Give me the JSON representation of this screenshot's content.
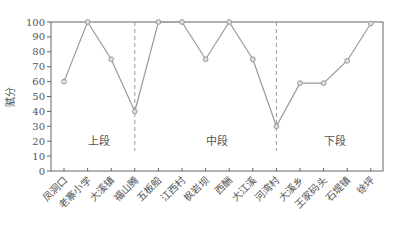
{
  "chart_data": {
    "type": "line",
    "title": "",
    "xlabel": "",
    "ylabel": "赋分",
    "ylim": [
      0,
      100
    ],
    "yticks": [
      0,
      10,
      20,
      30,
      40,
      50,
      60,
      70,
      80,
      90,
      100
    ],
    "grid": false,
    "legend": null,
    "categories": [
      "凤洞口",
      "老寨小学",
      "大溪镇",
      "福山腾",
      "五板船",
      "江西村",
      "枫岩坝",
      "西酬",
      "大江溪",
      "河湾村",
      "大溪乡",
      "王家码头",
      "石堤镇",
      "徐坪"
    ],
    "series": [
      {
        "name": "赋分",
        "values": [
          60,
          100,
          75,
          40,
          100,
          100,
          75,
          100,
          75,
          30,
          59,
          59,
          74,
          99
        ],
        "color": "#999999",
        "marker": "circle"
      }
    ],
    "segment_dividers": [
      {
        "after_category": "福山腾",
        "style": "dashed"
      },
      {
        "after_category": "河湾村",
        "style": "dashed"
      }
    ],
    "annotations": [
      {
        "text": "上段",
        "x_center_between": [
          "老寨小学",
          "大溪镇"
        ],
        "y": 20
      },
      {
        "text": "中段",
        "x_center_between": [
          "枫岩坝",
          "西酬"
        ],
        "y": 20
      },
      {
        "text": "下段",
        "x_center_between": [
          "王家码头",
          "石堤镇"
        ],
        "y": 20
      }
    ]
  },
  "colors": {
    "line": "#999999",
    "axis": "#666666",
    "text": "#555555",
    "background": "#ffffff"
  }
}
